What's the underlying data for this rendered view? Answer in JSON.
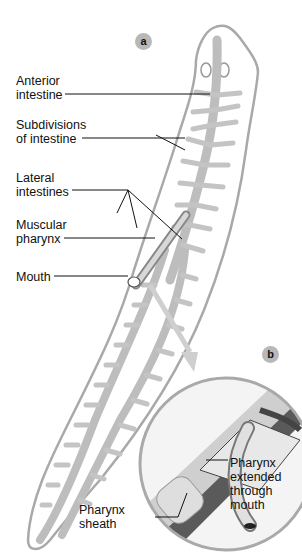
{
  "figure": {
    "panel_a": {
      "badge": "a",
      "labels": [
        {
          "id": "anterior-intestine",
          "text": "Anterior\nintestine"
        },
        {
          "id": "subdivisions-of-intestine",
          "text": "Subdivisions\nof intestine"
        },
        {
          "id": "lateral-intestines",
          "text": "Lateral\nintestines"
        },
        {
          "id": "muscular-pharynx",
          "text": "Muscular\npharynx"
        },
        {
          "id": "mouth",
          "text": "Mouth"
        }
      ]
    },
    "panel_b": {
      "badge": "b",
      "labels": [
        {
          "id": "pharynx-extended",
          "text": "Pharynx\nextended\nthrough\nmouth"
        },
        {
          "id": "pharynx-sheath",
          "text": "Pharynx\nsheath"
        }
      ]
    },
    "colors": {
      "outline": "#a9a9a9",
      "gut": "#bdbdbd",
      "badge": "#b8b8b8",
      "text": "#111111"
    }
  }
}
